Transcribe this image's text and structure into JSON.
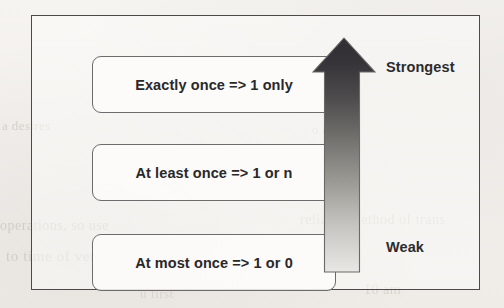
{
  "page": {
    "background_color": "#f4f2ef",
    "scan_ghost_text": [
      "a desires",
      "operations, so use",
      "to time of verification action",
      "o design",
      "reliable method of trans",
      "10 am",
      "u first"
    ]
  },
  "diagram": {
    "frame": {
      "border_color": "#4b4a49"
    },
    "boxes": [
      {
        "id": "exactly-once",
        "label": "Exactly once => 1 only",
        "border_color": "#6e6c6a"
      },
      {
        "id": "at-least-once",
        "label": "At least once => 1 or n",
        "border_color": "#6e6c6a"
      },
      {
        "id": "at-most-once",
        "label": "At most once => 1 or 0",
        "border_color": "#6e6c6a"
      }
    ],
    "arrow": {
      "name": "strength-gradient-arrow",
      "direction": "up",
      "gradient_top_color": "#353337",
      "gradient_bottom_color": "#e6e4e2",
      "outline_color": "#6b6966",
      "labels": {
        "top": "Strongest",
        "bottom": "Weak"
      }
    }
  }
}
